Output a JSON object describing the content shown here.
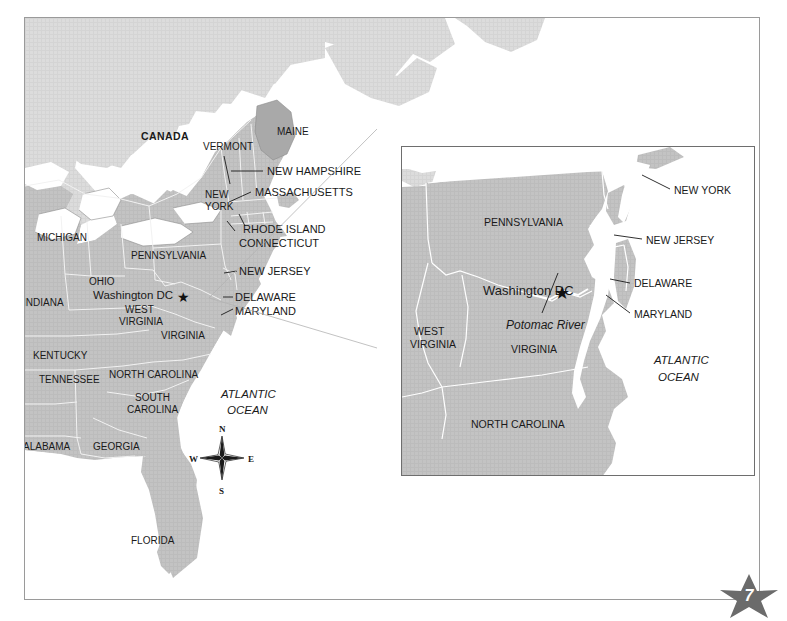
{
  "page": {
    "number": "7",
    "background_color": "#ffffff",
    "frame_color": "#9a9a9a"
  },
  "colors": {
    "land_us": "#bdbdbd",
    "land_canada": "#d6d6d6",
    "land_maine": "#a8a8a8",
    "water": "#ffffff",
    "state_border": "#ffffff",
    "coast_line": "#8c8c8c",
    "text": "#1a1a1a",
    "inset_border": "#6e6e6e",
    "connector": "#b3b3b3",
    "page_star": "#6b6b6b"
  },
  "main_map": {
    "name": "eastern-united-states-overview",
    "country_labels": [
      {
        "text": "CANADA",
        "x": 116,
        "y": 122
      }
    ],
    "state_labels": [
      {
        "text": "MAINE",
        "x": 252,
        "y": 117
      },
      {
        "text": "VERMONT",
        "x": 188,
        "y": 132
      },
      {
        "text": "NEW",
        "x": 180,
        "y": 180
      },
      {
        "text": "YORK",
        "x": 179,
        "y": 192
      },
      {
        "text": "MICHIGAN",
        "x": 22,
        "y": 223
      },
      {
        "text": "PENNSYLVANIA",
        "x": 114,
        "y": 241
      },
      {
        "text": "OHIO",
        "x": 68,
        "y": 267
      },
      {
        "text": "INDIANA",
        "x": 12,
        "y": 288
      },
      {
        "text": "WEST",
        "x": 104,
        "y": 295
      },
      {
        "text": "VIRGINIA",
        "x": 100,
        "y": 307
      },
      {
        "text": "VIRGINIA",
        "x": 142,
        "y": 321
      },
      {
        "text": "KENTUCKY",
        "x": 24,
        "y": 341
      },
      {
        "text": "TENNESSEE",
        "x": 29,
        "y": 365
      },
      {
        "text": "NORTH CAROLINA",
        "x": 106,
        "y": 360
      },
      {
        "text": "SOUTH",
        "x": 114,
        "y": 383
      },
      {
        "text": "CAROLINA",
        "x": 106,
        "y": 395
      },
      {
        "text": "ALABAMA",
        "x": 18,
        "y": 432
      },
      {
        "text": "GEORGIA",
        "x": 86,
        "y": 432
      },
      {
        "text": "FLORIDA",
        "x": 129,
        "y": 526
      }
    ],
    "city_label": {
      "text": "Washington DC",
      "x": 92,
      "y": 281,
      "marker": "star"
    },
    "ocean_label": {
      "line1": "ATLANTIC",
      "line2": "OCEAN",
      "x": 213,
      "y": 380
    },
    "callout_labels": [
      {
        "text": "NEW HAMPSHIRE",
        "x": 244,
        "y": 156
      },
      {
        "text": "MASSACHUSETTS",
        "x": 232,
        "y": 177
      },
      {
        "text": "RHODE ISLAND",
        "x": 220,
        "y": 214
      },
      {
        "text": "CONNECTICUT",
        "x": 216,
        "y": 228
      },
      {
        "text": "NEW JERSEY",
        "x": 216,
        "y": 256
      },
      {
        "text": "DELAWARE",
        "x": 212,
        "y": 282
      },
      {
        "text": "MARYLAND",
        "x": 212,
        "y": 296
      }
    ],
    "compass": {
      "name": "compass-rose",
      "cx": 197,
      "cy": 440,
      "labels": {
        "north": "N",
        "east": "E",
        "south": "S",
        "west": "W"
      }
    }
  },
  "inset_map": {
    "name": "washington-dc-detail-inset",
    "state_labels": [
      {
        "text": "PENNSYLVANIA",
        "x": 82,
        "y": 79
      },
      {
        "text": "WEST",
        "x": 12,
        "y": 188
      },
      {
        "text": "VIRGINIA",
        "x": 8,
        "y": 201
      },
      {
        "text": "VIRGINIA",
        "x": 109,
        "y": 206
      },
      {
        "text": "NORTH CAROLINA",
        "x": 69,
        "y": 281
      }
    ],
    "city_label": {
      "text": "Washington DC",
      "x": 81,
      "y": 143,
      "marker": "star"
    },
    "river_label": {
      "text": "Potomac River",
      "x": 104,
      "y": 180
    },
    "ocean_label": {
      "line1": "ATLANTIC",
      "line2": "OCEAN",
      "x": 252,
      "y": 216
    },
    "callout_labels": [
      {
        "text": "NEW YORK",
        "x": 273,
        "y": 46
      },
      {
        "text": "NEW JERSEY",
        "x": 245,
        "y": 96
      },
      {
        "text": "DELAWARE",
        "x": 232,
        "y": 139
      },
      {
        "text": "MARYLAND",
        "x": 232,
        "y": 170
      }
    ]
  }
}
